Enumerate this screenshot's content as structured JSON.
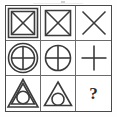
{
  "puzzle": {
    "title": "Matrix Reasoning Puzzle",
    "grid_rows": 3,
    "grid_cols": 3,
    "stroke_color": "#3b3b3b",
    "border_color": "#4a4a4a",
    "background_color": "#ffffff",
    "cells": [
      {
        "position": "row1-col1",
        "description": "double square with X diagonals",
        "outer_shape": "square",
        "outer_count": 2,
        "inner_shape": "x-cross",
        "label": ""
      },
      {
        "position": "row1-col2",
        "description": "single square with X diagonals",
        "outer_shape": "square",
        "outer_count": 1,
        "inner_shape": "x-cross",
        "label": ""
      },
      {
        "position": "row1-col3",
        "description": "X diagonals only",
        "outer_shape": "none",
        "outer_count": 0,
        "inner_shape": "x-cross",
        "label": ""
      },
      {
        "position": "row2-col1",
        "description": "double circle with plus cross",
        "outer_shape": "circle",
        "outer_count": 2,
        "inner_shape": "plus-cross",
        "label": ""
      },
      {
        "position": "row2-col2",
        "description": "single circle with plus cross",
        "outer_shape": "circle",
        "outer_count": 1,
        "inner_shape": "plus-cross",
        "label": ""
      },
      {
        "position": "row2-col3",
        "description": "plus cross only",
        "outer_shape": "none",
        "outer_count": 0,
        "inner_shape": "plus-cross",
        "label": ""
      },
      {
        "position": "row3-col1",
        "description": "double triangle with inscribed circle",
        "outer_shape": "triangle",
        "outer_count": 2,
        "inner_shape": "circle",
        "label": ""
      },
      {
        "position": "row3-col2",
        "description": "single triangle with inscribed circle",
        "outer_shape": "triangle",
        "outer_count": 1,
        "inner_shape": "circle",
        "label": ""
      },
      {
        "position": "row3-col3",
        "description": "missing element, question mark",
        "outer_shape": "none",
        "outer_count": 0,
        "inner_shape": "question-mark",
        "label": "?"
      }
    ]
  }
}
